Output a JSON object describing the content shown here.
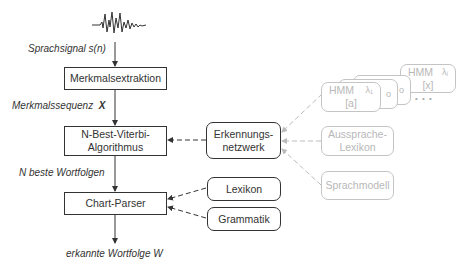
{
  "diagram": {
    "signal": {
      "icon": "waveform-icon",
      "label": "Sprachsignal s(n)"
    },
    "pipeline": [
      {
        "id": "feature-extraction",
        "label": "Merkmalsextraktion"
      },
      {
        "id": "nbest-viterbi",
        "line1": "N-Best-Viterbi-",
        "line2": "Algorithmus"
      },
      {
        "id": "chart-parser",
        "label": "Chart-Parser"
      }
    ],
    "edge_labels": {
      "feature_sequence_text": "Merkmalssequenz",
      "feature_sequence_symbol": "X",
      "nbest": "N beste Wortfolgen",
      "output": "erkannte Wortfolge W"
    },
    "knowledge": {
      "recognition_network": {
        "line1": "Erkennungs-",
        "line2": "netzwerk"
      },
      "lexicon": "Lexikon",
      "grammar": "Grammatik"
    },
    "sources": {
      "hmm_front": {
        "title": "HMM",
        "lambda": "λ₁",
        "phone": "[a]"
      },
      "hmm_back": {
        "title": "HMM",
        "lambda": "λⱼ",
        "phone": "[x]"
      },
      "hmm_mid_glyphs": [
        "o",
        "o"
      ],
      "ellipsis": "• • •",
      "pronunciation_lexicon": {
        "line1": "Aussprache-",
        "line2": "Lexikon"
      },
      "language_model": "Sprachmodell"
    },
    "colors": {
      "primary_stroke": "#333333",
      "faded_stroke": "#c4c4c4",
      "faded_text": "#b8b8b8",
      "background": "#ffffff"
    }
  }
}
